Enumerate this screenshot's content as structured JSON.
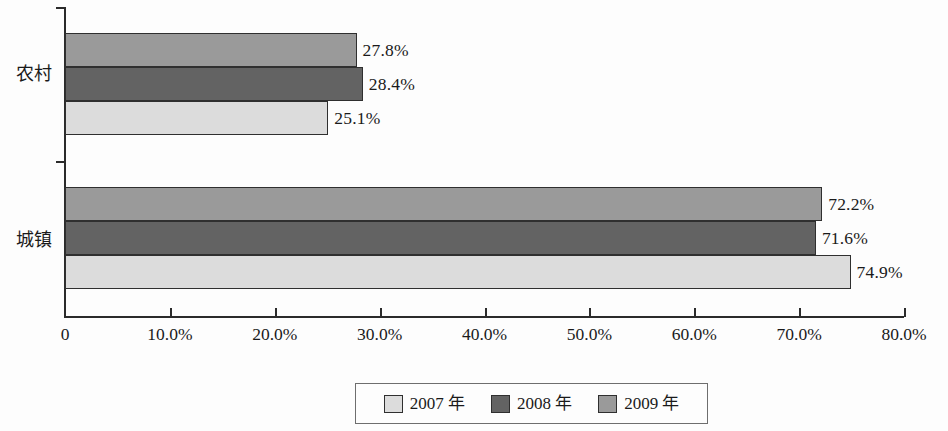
{
  "chart_data": {
    "type": "bar",
    "orientation": "horizontal",
    "title": "",
    "xlabel": "",
    "ylabel": "",
    "categories": [
      "农村",
      "城镇"
    ],
    "series": [
      {
        "name": "2007 年",
        "values": [
          25.1,
          74.9
        ],
        "color": "#dcdcdc"
      },
      {
        "name": "2008 年",
        "values": [
          28.4,
          71.6
        ],
        "color": "#636363"
      },
      {
        "name": "2009 年",
        "values": [
          27.8,
          72.2
        ],
        "color": "#9a9a9a"
      }
    ],
    "series_order_top_to_bottom": [
      "2009 年",
      "2008 年",
      "2007 年"
    ],
    "value_labels": {
      "农村": {
        "2009 年": "27.8%",
        "2008 年": "28.4%",
        "2007 年": "25.1%"
      },
      "城镇": {
        "2009 年": "72.2%",
        "2008 年": "71.6%",
        "2007 年": "74.9%"
      }
    },
    "xlim": [
      0,
      80
    ],
    "xticks": [
      0,
      10,
      20,
      30,
      40,
      50,
      60,
      70,
      80
    ],
    "xticklabels": [
      "0",
      "10.0%",
      "20.0%",
      "30.0%",
      "40.0%",
      "50.0%",
      "60.0%",
      "70.0%",
      "80.0%"
    ],
    "grid": false,
    "legend_position": "bottom"
  },
  "axis": {
    "ticks": [
      {
        "value": 0,
        "label": "0"
      },
      {
        "value": 10,
        "label": "10.0%"
      },
      {
        "value": 20,
        "label": "20.0%"
      },
      {
        "value": 30,
        "label": "30.0%"
      },
      {
        "value": 40,
        "label": "40.0%"
      },
      {
        "value": 50,
        "label": "50.0%"
      },
      {
        "value": 60,
        "label": "60.0%"
      },
      {
        "value": 70,
        "label": "70.0%"
      },
      {
        "value": 80,
        "label": "80.0%"
      }
    ]
  },
  "categories": [
    {
      "id": "rural",
      "label": "农村"
    },
    {
      "id": "urban",
      "label": "城镇"
    }
  ],
  "legend": {
    "items": [
      {
        "label": "2007 年",
        "color": "#dcdcdc"
      },
      {
        "label": "2008 年",
        "color": "#636363"
      },
      {
        "label": "2009 年",
        "color": "#9a9a9a"
      }
    ]
  },
  "bars": [
    {
      "category": "农村",
      "series": "2009 年",
      "value": 27.8,
      "label": "27.8%",
      "color": "#9a9a9a"
    },
    {
      "category": "农村",
      "series": "2008 年",
      "value": 28.4,
      "label": "28.4%",
      "color": "#636363"
    },
    {
      "category": "农村",
      "series": "2007 年",
      "value": 25.1,
      "label": "25.1%",
      "color": "#dcdcdc"
    },
    {
      "category": "城镇",
      "series": "2009 年",
      "value": 72.2,
      "label": "72.2%",
      "color": "#9a9a9a"
    },
    {
      "category": "城镇",
      "series": "2008 年",
      "value": 71.6,
      "label": "71.6%",
      "color": "#636363"
    },
    {
      "category": "城镇",
      "series": "2007 年",
      "value": 74.9,
      "label": "74.9%",
      "color": "#dcdcdc"
    }
  ]
}
